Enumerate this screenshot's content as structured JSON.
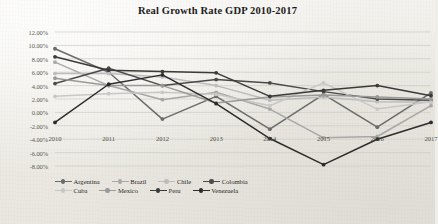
{
  "chart_data": {
    "type": "line",
    "title": "Real Growth Rate GDP 2010-2017",
    "xlabel": "",
    "ylabel": "",
    "grid": true,
    "legend_position": "bottom",
    "ylim": [
      -8,
      12
    ],
    "ytick_step": 2,
    "ytick_labels": [
      "12.00%",
      "10.00%",
      "8.00%",
      "6.00%",
      "4.00%",
      "2.00%",
      "0.00%",
      "-2.00%",
      "-4.00%",
      "-6.00%",
      "-8.00%"
    ],
    "ytick_values": [
      12,
      10,
      8,
      6,
      4,
      2,
      0,
      -2,
      -4,
      -6,
      -8
    ],
    "categories": [
      "2010",
      "2011",
      "2012",
      "2013",
      "2014",
      "2015",
      "2016",
      "2017"
    ],
    "series": [
      {
        "name": "Argentina",
        "color": "#6b6b6b",
        "values": [
          9.5,
          6.0,
          -1.0,
          2.4,
          -2.5,
          2.7,
          -2.2,
          2.9
        ]
      },
      {
        "name": "Brazil",
        "color": "#a8a8a8",
        "values": [
          7.5,
          4.0,
          1.9,
          3.0,
          0.5,
          -3.8,
          -3.6,
          1.0
        ]
      },
      {
        "name": "Chile",
        "color": "#bdbdbd",
        "values": [
          5.8,
          5.8,
          5.3,
          4.0,
          1.8,
          2.3,
          1.6,
          1.5
        ]
      },
      {
        "name": "Colombia",
        "color": "#4a4a4a",
        "values": [
          4.3,
          6.6,
          4.0,
          4.9,
          4.4,
          3.1,
          2.0,
          1.8
        ]
      },
      {
        "name": "Cuba",
        "color": "#c8c8c8",
        "values": [
          2.4,
          2.8,
          3.0,
          2.7,
          1.0,
          4.4,
          0.5,
          1.6
        ]
      },
      {
        "name": "Mexico",
        "color": "#9a9a9a",
        "values": [
          5.1,
          4.0,
          4.0,
          1.4,
          2.3,
          2.6,
          2.3,
          2.0
        ]
      },
      {
        "name": "Peru",
        "color": "#3a3a3a",
        "values": [
          8.3,
          6.3,
          6.1,
          5.9,
          2.4,
          3.3,
          4.0,
          2.5
        ]
      },
      {
        "name": "Venezuela",
        "color": "#2b2b2b",
        "values": [
          -1.5,
          4.2,
          5.6,
          1.3,
          -3.9,
          -7.8,
          -4.0,
          -1.5
        ]
      }
    ]
  },
  "legend": {
    "rows": [
      [
        "Argentina",
        "Brazil",
        "Chile",
        "Colombia"
      ],
      [
        "Cuba",
        "Mexico",
        "Peru",
        "Venezuela"
      ]
    ]
  }
}
